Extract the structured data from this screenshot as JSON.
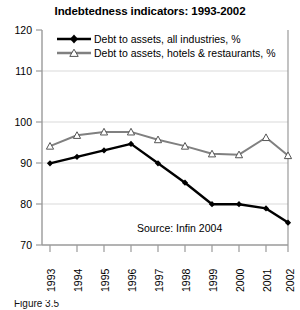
{
  "chart_data": {
    "type": "line",
    "title": "Indebtedness indicators: 1993-2002",
    "xlabel": "",
    "ylabel": "",
    "categories": [
      "1993",
      "1994",
      "1995",
      "1996",
      "1997",
      "1998",
      "1999",
      "2000",
      "2001",
      "2002"
    ],
    "series": [
      {
        "name": "Debt to assets, all industries, %",
        "marker": "filled-diamond",
        "color": "#000000",
        "values": [
          89.0,
          90.5,
          92.0,
          93.5,
          89.0,
          84.5,
          79.5,
          79.5,
          78.5,
          75.2
        ]
      },
      {
        "name": "Debt to assets, hotels & restaurants, %",
        "marker": "open-triangle",
        "color": "#808080",
        "values": [
          93.0,
          95.5,
          96.3,
          96.3,
          94.5,
          93.0,
          91.2,
          91.0,
          95.0,
          90.8
        ]
      }
    ],
    "ylim": [
      70,
      120
    ],
    "yticks": [
      70,
      80,
      90,
      100,
      110,
      120
    ],
    "grid": "horizontal",
    "legend_position": "top-inside",
    "annotations": [
      {
        "text": "Source: Infin 2004"
      }
    ]
  },
  "axis": {
    "y_tick_labels": [
      "120",
      "110",
      "100",
      "90",
      "80",
      "70"
    ],
    "x_tick_labels": [
      "1993",
      "1994",
      "1995",
      "1996",
      "1997",
      "1998",
      "1999",
      "2000",
      "2001",
      "2002"
    ]
  },
  "legend": {
    "items": [
      {
        "label": "Debt to assets, all industries, %"
      },
      {
        "label": "Debt to assets, hotels & restaurants, %"
      }
    ]
  },
  "notes": {
    "source": "Source: Infin 2004"
  },
  "caption": {
    "text": "Figure 3.5"
  },
  "colors": {
    "series_black": "#000000",
    "series_gray": "#808080",
    "axis": "#808080",
    "grid": "#d9d9d9",
    "text": "#000000"
  }
}
